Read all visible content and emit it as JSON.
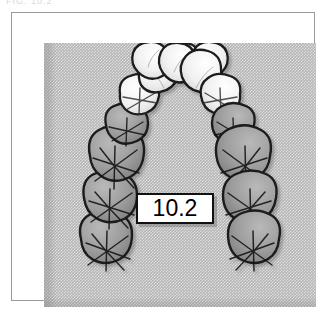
{
  "figure": {
    "caption_fragment": "FIG. 10.2",
    "label": "10.2",
    "label_box_color": "#ffffff",
    "label_border_color": "#111111",
    "background_color": "#b4b4b4",
    "frame_color": "#9a9a9a",
    "page_color": "#ffffff",
    "arch_type": "maxillary"
  },
  "teeth": {
    "anterior_fill": "#f2f2f2",
    "posterior_fill": "#9a9a9a",
    "outline_color": "#1a1a1a",
    "right_side": [
      {
        "name": "central-incisor",
        "shade": "light"
      },
      {
        "name": "lateral-incisor",
        "shade": "light"
      },
      {
        "name": "canine",
        "shade": "light"
      },
      {
        "name": "first-premolar",
        "shade": "light"
      },
      {
        "name": "second-premolar",
        "shade": "dark"
      },
      {
        "name": "first-molar",
        "shade": "dark"
      },
      {
        "name": "second-molar",
        "shade": "dark"
      },
      {
        "name": "third-molar",
        "shade": "dark"
      }
    ],
    "left_side": [
      {
        "name": "central-incisor",
        "shade": "light"
      },
      {
        "name": "lateral-incisor",
        "shade": "light"
      },
      {
        "name": "canine",
        "shade": "light"
      },
      {
        "name": "first-premolar",
        "shade": "light"
      },
      {
        "name": "second-premolar",
        "shade": "dark"
      },
      {
        "name": "first-molar",
        "shade": "dark"
      },
      {
        "name": "second-molar",
        "shade": "dark"
      },
      {
        "name": "third-molar",
        "shade": "dark"
      }
    ],
    "total_count": 16
  }
}
